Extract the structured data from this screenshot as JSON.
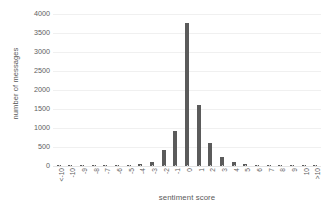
{
  "chart_data": {
    "type": "bar",
    "title": "",
    "xlabel": "sentiment score",
    "ylabel": "number of messages",
    "categories": [
      "<-10",
      "-10",
      "-9",
      "-8",
      "-7",
      "-6",
      "-5",
      "-4",
      "-3",
      "-2",
      "-1",
      "0",
      "1",
      "2",
      "3",
      "4",
      "5",
      "6",
      "7",
      "8",
      "9",
      "10",
      ">10"
    ],
    "values": [
      2,
      1,
      1,
      2,
      3,
      6,
      14,
      45,
      95,
      430,
      930,
      3760,
      1600,
      610,
      240,
      110,
      60,
      30,
      8,
      4,
      2,
      1,
      2
    ],
    "ylim": [
      0,
      4000
    ],
    "yticks": [
      0,
      500,
      1000,
      1500,
      2000,
      2500,
      3000,
      3500,
      4000
    ],
    "ytick_labels": [
      "0",
      "500",
      "1000",
      "1500",
      "2000",
      "2500",
      "3000",
      "3500",
      "4000"
    ],
    "grid": true,
    "legend": false,
    "legend_position": "none",
    "bar_color": "#5b5b5b",
    "gridline_color": "#f0f0f0",
    "text_color": "#5e5e5e",
    "background_color": "#ffffff"
  }
}
